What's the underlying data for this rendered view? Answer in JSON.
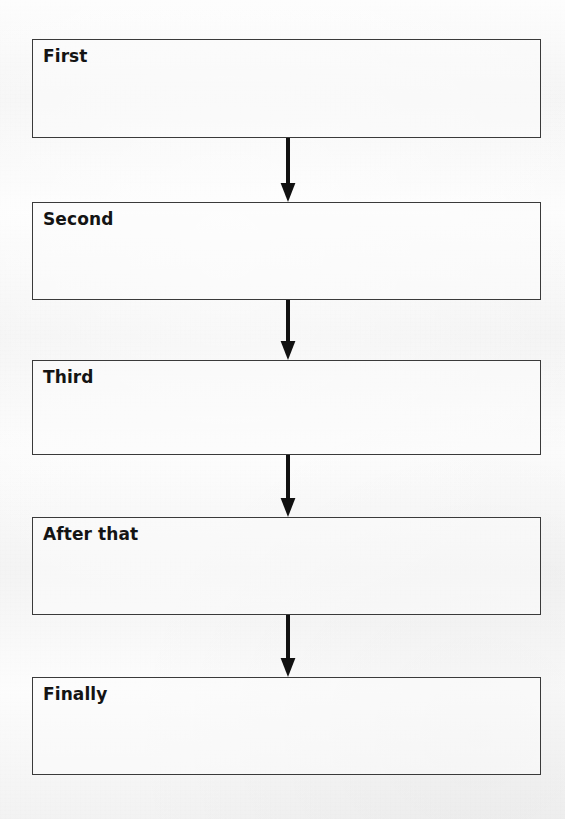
{
  "document": {
    "type": "flowchart",
    "orientation": "vertical",
    "background_color": "#f3f3f3",
    "box_border_color": "#3a3a3a",
    "box_fill_color": "#fcfcfc",
    "arrow_color": "#111111",
    "text_color": "#141414"
  },
  "flowchart": {
    "nodes": [
      {
        "label": "First",
        "x": 32,
        "y": 39,
        "width": 509,
        "height": 99
      },
      {
        "label": "Second",
        "x": 32,
        "y": 202,
        "width": 509,
        "height": 98
      },
      {
        "label": "Third",
        "x": 32,
        "y": 360,
        "width": 509,
        "height": 95
      },
      {
        "label": "After that",
        "x": 32,
        "y": 517,
        "width": 509,
        "height": 98
      },
      {
        "label": "Finally",
        "x": 32,
        "y": 677,
        "width": 509,
        "height": 98
      }
    ],
    "connectors": [
      {
        "name": "arrow-first-to-second",
        "from": "First",
        "to": "Second",
        "x": 288,
        "y": 138,
        "length": 64,
        "direction": "down"
      },
      {
        "name": "arrow-second-to-third",
        "from": "Second",
        "to": "Third",
        "x": 288,
        "y": 300,
        "length": 60,
        "direction": "down"
      },
      {
        "name": "arrow-third-to-after-that",
        "from": "Third",
        "to": "After that",
        "x": 288,
        "y": 455,
        "length": 62,
        "direction": "down"
      },
      {
        "name": "arrow-after-that-to-finally",
        "from": "After that",
        "to": "Finally",
        "x": 288,
        "y": 615,
        "length": 62,
        "direction": "down"
      }
    ]
  }
}
